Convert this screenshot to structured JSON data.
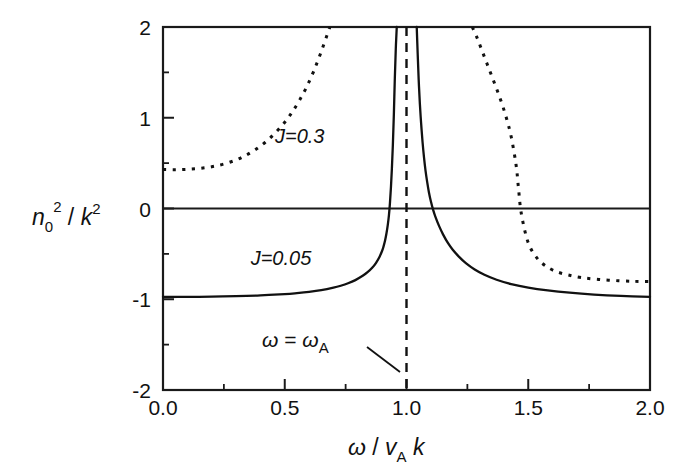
{
  "figure": {
    "name": "dispersion-plot",
    "background": "#ffffff",
    "foreground": "#111111"
  },
  "axes": {
    "x": {
      "label_parts": {
        "omega": "ω",
        "slash": " / ",
        "v": "v",
        "sub_A": "A",
        "k": "k"
      },
      "label_full": "ω / v_A k",
      "ticks": [
        "0.0",
        "0.5",
        "1.0",
        "1.5",
        "2.0"
      ],
      "tick_values": [
        0.0,
        0.5,
        1.0,
        1.5,
        2.0
      ],
      "minor_tick_values": [
        0.25,
        0.75,
        1.25,
        1.75
      ],
      "range": [
        0.0,
        2.0
      ]
    },
    "y": {
      "label_parts": {
        "n": "n",
        "sub_0": "0",
        "sup_2a": "2",
        "slash": " / ",
        "k": "k",
        "sup_2b": "2"
      },
      "label_full": "n_0^2 / k^2",
      "ticks": [
        "2",
        "1",
        "0",
        "-1",
        "-2"
      ],
      "tick_values": [
        2,
        1,
        0,
        -1,
        -2
      ],
      "minor_tick_values": [
        1.5,
        0.5,
        -0.5,
        -1.5
      ],
      "range": [
        -2,
        2
      ]
    }
  },
  "annotations": {
    "curve_solid_label": "J=0.05",
    "curve_dotted_label": "J=0.3",
    "resonance_label_parts": {
      "omega": "ω",
      "equals": " = ",
      "omega2": "ω",
      "sub_A": "A"
    },
    "resonance_label_full": "ω = ω_A",
    "resonance_x": 1.0
  },
  "chart_data": {
    "type": "line",
    "title": "",
    "xlabel": "ω / v_A k",
    "ylabel": "n_0^2 / k^2",
    "xlim": [
      0.0,
      2.0
    ],
    "ylim": [
      -2,
      2
    ],
    "grid": false,
    "legend": "inline-labels",
    "vertical_reference_line": {
      "x": 1.0,
      "style": "dashed",
      "label": "ω = ω_A"
    },
    "horizontal_reference_line": {
      "y": 0,
      "style": "solid"
    },
    "series": [
      {
        "name": "J=0.05",
        "style": "solid",
        "label_position": {
          "x": 0.36,
          "y": -0.62
        },
        "asymptote_x": 1.0,
        "zero_crossings": [
          0.905,
          1.08
        ],
        "points_left": [
          [
            0.0,
            -0.975
          ],
          [
            0.1,
            -0.974
          ],
          [
            0.2,
            -0.971
          ],
          [
            0.3,
            -0.966
          ],
          [
            0.4,
            -0.957
          ],
          [
            0.5,
            -0.943
          ],
          [
            0.55,
            -0.932
          ],
          [
            0.6,
            -0.918
          ],
          [
            0.65,
            -0.899
          ],
          [
            0.7,
            -0.872
          ],
          [
            0.73,
            -0.851
          ],
          [
            0.76,
            -0.824
          ],
          [
            0.79,
            -0.789
          ],
          [
            0.82,
            -0.742
          ],
          [
            0.84,
            -0.702
          ],
          [
            0.86,
            -0.65
          ],
          [
            0.875,
            -0.598
          ],
          [
            0.89,
            -0.528
          ],
          [
            0.9,
            -0.466
          ],
          [
            0.905,
            -0.425
          ],
          [
            0.912,
            -0.352
          ],
          [
            0.918,
            -0.27
          ],
          [
            0.923,
            -0.184
          ],
          [
            0.928,
            -0.07
          ],
          [
            0.932,
            0.06
          ],
          [
            0.936,
            0.23
          ],
          [
            0.94,
            0.44
          ],
          [
            0.944,
            0.7
          ],
          [
            0.948,
            1.03
          ],
          [
            0.952,
            1.43
          ],
          [
            0.956,
            1.76
          ],
          [
            0.96,
            2.0
          ]
        ],
        "points_right": [
          [
            1.042,
            2.0
          ],
          [
            1.046,
            1.7
          ],
          [
            1.05,
            1.42
          ],
          [
            1.055,
            1.15
          ],
          [
            1.06,
            0.94
          ],
          [
            1.066,
            0.73
          ],
          [
            1.072,
            0.56
          ],
          [
            1.078,
            0.42
          ],
          [
            1.085,
            0.29
          ],
          [
            1.092,
            0.18
          ],
          [
            1.1,
            0.08
          ],
          [
            1.11,
            -0.02
          ],
          [
            1.12,
            -0.1
          ],
          [
            1.135,
            -0.2
          ],
          [
            1.15,
            -0.285
          ],
          [
            1.17,
            -0.38
          ],
          [
            1.19,
            -0.455
          ],
          [
            1.215,
            -0.53
          ],
          [
            1.245,
            -0.605
          ],
          [
            1.28,
            -0.672
          ],
          [
            1.32,
            -0.73
          ],
          [
            1.37,
            -0.785
          ],
          [
            1.43,
            -0.833
          ],
          [
            1.5,
            -0.872
          ],
          [
            1.58,
            -0.903
          ],
          [
            1.67,
            -0.928
          ],
          [
            1.77,
            -0.948
          ],
          [
            1.88,
            -0.963
          ],
          [
            2.0,
            -0.973
          ]
        ]
      },
      {
        "name": "J=0.3",
        "style": "dotted",
        "label_position": {
          "x": 0.46,
          "y": 0.72
        },
        "asymptote_x": 1.0,
        "zero_crossings": [
          1.46
        ],
        "points_left": [
          [
            0.0,
            0.43
          ],
          [
            0.05,
            0.428
          ],
          [
            0.1,
            0.432
          ],
          [
            0.15,
            0.442
          ],
          [
            0.2,
            0.46
          ],
          [
            0.25,
            0.49
          ],
          [
            0.3,
            0.535
          ],
          [
            0.34,
            0.585
          ],
          [
            0.38,
            0.65
          ],
          [
            0.42,
            0.73
          ],
          [
            0.46,
            0.83
          ],
          [
            0.5,
            0.95
          ],
          [
            0.53,
            1.06
          ],
          [
            0.56,
            1.19
          ],
          [
            0.59,
            1.34
          ],
          [
            0.62,
            1.52
          ],
          [
            0.65,
            1.73
          ],
          [
            0.68,
            1.96
          ],
          [
            0.685,
            2.0
          ]
        ],
        "points_right": [
          [
            1.27,
            2.0
          ],
          [
            1.29,
            1.88
          ],
          [
            1.31,
            1.74
          ],
          [
            1.33,
            1.6
          ],
          [
            1.35,
            1.46
          ],
          [
            1.37,
            1.32
          ],
          [
            1.39,
            1.17
          ],
          [
            1.41,
            1.0
          ],
          [
            1.43,
            0.79
          ],
          [
            1.45,
            0.48
          ],
          [
            1.46,
            0.22
          ],
          [
            1.47,
            -0.03
          ],
          [
            1.49,
            -0.29
          ],
          [
            1.51,
            -0.44
          ],
          [
            1.54,
            -0.56
          ],
          [
            1.57,
            -0.63
          ],
          [
            1.61,
            -0.69
          ],
          [
            1.66,
            -0.73
          ],
          [
            1.72,
            -0.762
          ],
          [
            1.79,
            -0.782
          ],
          [
            1.87,
            -0.796
          ],
          [
            1.94,
            -0.803
          ],
          [
            2.0,
            -0.806
          ]
        ]
      }
    ]
  }
}
